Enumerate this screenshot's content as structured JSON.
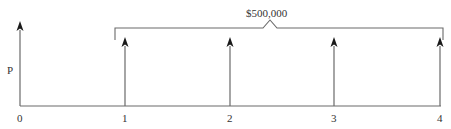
{
  "diagram": {
    "type": "cash-flow-diagram",
    "present_value_label": "P",
    "bracket_label": "$500,000",
    "time_labels": [
      "0",
      "1",
      "2",
      "3",
      "4"
    ],
    "colors": {
      "line": "#6a6a6a",
      "arrowhead": "#1a1a1a",
      "text": "#333333"
    }
  }
}
